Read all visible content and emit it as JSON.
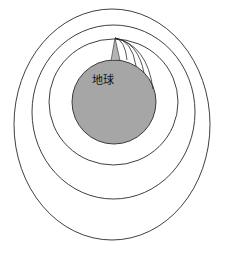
{
  "diagram": {
    "earth_label": "地球",
    "colors": {
      "earth_fill": "#a6a6a6",
      "mountain_fill": "#b3b3b3",
      "line": "#2a2a2a",
      "background": "#ffffff"
    },
    "earth": {
      "cx": 114,
      "cy": 102,
      "r": 42
    },
    "mountain_peak": {
      "x": 115,
      "y": 38
    },
    "orbits": [
      {
        "name": "inner-orbit",
        "left": 49,
        "right": 178,
        "top": 39,
        "bottom": 165
      },
      {
        "name": "middle-orbit",
        "left": 32,
        "right": 195,
        "top": 25,
        "bottom": 199
      },
      {
        "name": "outer-orbit",
        "left": 14,
        "right": 210,
        "top": 9,
        "bottom": 240
      }
    ],
    "trajectories": [
      {
        "name": "trajectory-1",
        "end": [
          127,
          60
        ]
      },
      {
        "name": "trajectory-2",
        "end": [
          136,
          66
        ]
      },
      {
        "name": "trajectory-3",
        "end": [
          144,
          73
        ]
      },
      {
        "name": "trajectory-4",
        "end": [
          153,
          89
        ]
      }
    ]
  }
}
